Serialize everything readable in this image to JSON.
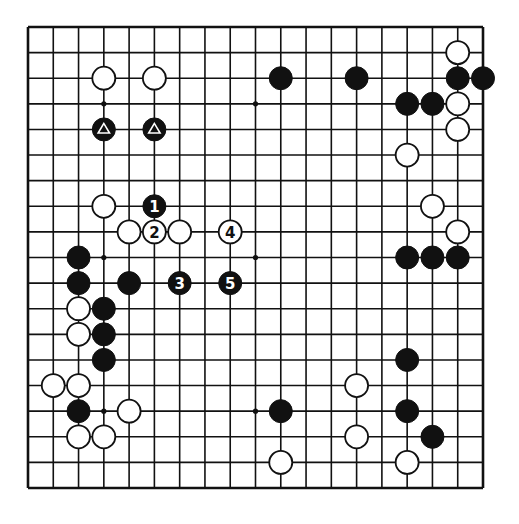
{
  "board": {
    "size": 19,
    "colors": {
      "line": "#111111",
      "black_stone": "#111111",
      "white_stone": "#ffffff",
      "background": "#ffffff"
    },
    "star_points": [
      [
        3,
        3
      ],
      [
        9,
        3
      ],
      [
        15,
        3
      ],
      [
        3,
        9
      ],
      [
        9,
        9
      ],
      [
        15,
        9
      ],
      [
        3,
        15
      ],
      [
        9,
        15
      ],
      [
        15,
        15
      ]
    ],
    "stones": [
      {
        "color": "white",
        "col": 17,
        "row": 1
      },
      {
        "color": "black",
        "col": 10,
        "row": 2
      },
      {
        "color": "black",
        "col": 13,
        "row": 2
      },
      {
        "color": "black",
        "col": 17,
        "row": 2
      },
      {
        "color": "black",
        "col": 18,
        "row": 2
      },
      {
        "color": "white",
        "col": 3,
        "row": 2
      },
      {
        "color": "white",
        "col": 5,
        "row": 2
      },
      {
        "color": "black",
        "col": 15,
        "row": 3
      },
      {
        "color": "black",
        "col": 16,
        "row": 3
      },
      {
        "color": "white",
        "col": 17,
        "row": 3
      },
      {
        "color": "black",
        "col": 3,
        "row": 4,
        "marker": "triangle"
      },
      {
        "color": "black",
        "col": 5,
        "row": 4,
        "marker": "triangle"
      },
      {
        "color": "white",
        "col": 17,
        "row": 4
      },
      {
        "color": "white",
        "col": 15,
        "row": 5
      },
      {
        "color": "white",
        "col": 3,
        "row": 7
      },
      {
        "color": "black",
        "col": 5,
        "row": 7,
        "label": "1"
      },
      {
        "color": "white",
        "col": 16,
        "row": 7
      },
      {
        "color": "white",
        "col": 4,
        "row": 8
      },
      {
        "color": "white",
        "col": 5,
        "row": 8,
        "label": "2"
      },
      {
        "color": "white",
        "col": 6,
        "row": 8
      },
      {
        "color": "white",
        "col": 8,
        "row": 8,
        "label": "4"
      },
      {
        "color": "white",
        "col": 17,
        "row": 8
      },
      {
        "color": "black",
        "col": 2,
        "row": 9
      },
      {
        "color": "black",
        "col": 15,
        "row": 9
      },
      {
        "color": "black",
        "col": 16,
        "row": 9
      },
      {
        "color": "black",
        "col": 17,
        "row": 9
      },
      {
        "color": "black",
        "col": 2,
        "row": 10
      },
      {
        "color": "black",
        "col": 4,
        "row": 10
      },
      {
        "color": "black",
        "col": 6,
        "row": 10,
        "label": "3"
      },
      {
        "color": "black",
        "col": 8,
        "row": 10,
        "label": "5"
      },
      {
        "color": "white",
        "col": 2,
        "row": 11
      },
      {
        "color": "black",
        "col": 3,
        "row": 11
      },
      {
        "color": "white",
        "col": 2,
        "row": 12
      },
      {
        "color": "black",
        "col": 3,
        "row": 12
      },
      {
        "color": "black",
        "col": 3,
        "row": 13
      },
      {
        "color": "black",
        "col": 15,
        "row": 13
      },
      {
        "color": "white",
        "col": 1,
        "row": 14
      },
      {
        "color": "white",
        "col": 2,
        "row": 14
      },
      {
        "color": "white",
        "col": 13,
        "row": 14
      },
      {
        "color": "black",
        "col": 2,
        "row": 15
      },
      {
        "color": "white",
        "col": 4,
        "row": 15
      },
      {
        "color": "black",
        "col": 10,
        "row": 15
      },
      {
        "color": "black",
        "col": 15,
        "row": 15
      },
      {
        "color": "white",
        "col": 2,
        "row": 16
      },
      {
        "color": "white",
        "col": 3,
        "row": 16
      },
      {
        "color": "white",
        "col": 13,
        "row": 16
      },
      {
        "color": "black",
        "col": 16,
        "row": 16
      },
      {
        "color": "white",
        "col": 10,
        "row": 17
      },
      {
        "color": "white",
        "col": 15,
        "row": 17
      }
    ]
  }
}
